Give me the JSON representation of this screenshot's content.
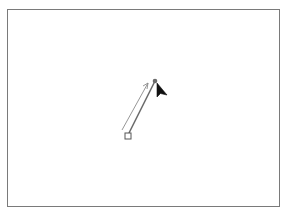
{
  "canvas": {
    "background": "#ffffff",
    "border_color": "#7a7a7a"
  },
  "drawing": {
    "line": {
      "x1": 129,
      "y1": 133,
      "x2": 155,
      "y2": 81,
      "color": "#6a6a6a"
    },
    "direction_arrow": {
      "x1": 122,
      "y1": 130,
      "x2": 148,
      "y2": 83,
      "color": "#8a8a8a"
    },
    "start_handle": {
      "x": 128,
      "y": 136,
      "size": 6,
      "shape": "square"
    },
    "end_handle": {
      "x": 155,
      "y": 81,
      "shape": "dot",
      "color": "#6a6a6a"
    },
    "cursor": {
      "icon": "arrow-pointer-icon",
      "x": 157,
      "y": 83
    }
  }
}
